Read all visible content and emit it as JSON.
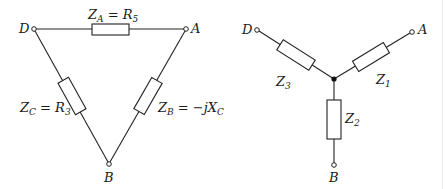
{
  "delta": {
    "terminals": {
      "D": "D",
      "A": "A",
      "B": "B"
    },
    "top_label": {
      "main": "Z",
      "sub": "A",
      "eq": " = R",
      "eqsub": "5"
    },
    "left_label": {
      "main": "Z",
      "sub": "C",
      "eq": " = R",
      "eqsub": "3"
    },
    "right_label": {
      "main": "Z",
      "sub": "B",
      "eq": " = −jX",
      "eqsub": "C"
    }
  },
  "star": {
    "terminals": {
      "D": "D",
      "A": "A",
      "B": "B"
    },
    "z1": {
      "main": "Z",
      "sub": "1"
    },
    "z2": {
      "main": "Z",
      "sub": "2"
    },
    "z3": {
      "main": "Z",
      "sub": "3"
    }
  }
}
